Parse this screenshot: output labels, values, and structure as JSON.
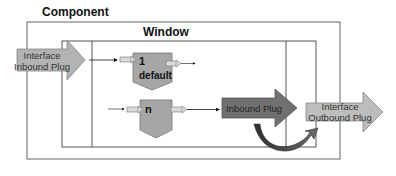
{
  "diagram": {
    "component": {
      "label": "Component"
    },
    "window": {
      "label": "Window"
    },
    "interface_inbound_plug": {
      "line1": "Interface",
      "line2": "Inbound Plug",
      "fill": "#b3b3b3"
    },
    "outbound_plug_1": {
      "number": "1",
      "name": "default",
      "fill": "#a6a6a6"
    },
    "outbound_plug_n": {
      "number": "n",
      "fill": "#a6a6a6"
    },
    "inbound_plug": {
      "label": "Inbound Plug",
      "fill": "#707070"
    },
    "interface_outbound_plug": {
      "line1": "Interface",
      "line2": "Outbound Plug",
      "fill": "#bdbdbd"
    },
    "colors": {
      "line": "#555555",
      "curve": "#3a3a3a"
    }
  }
}
